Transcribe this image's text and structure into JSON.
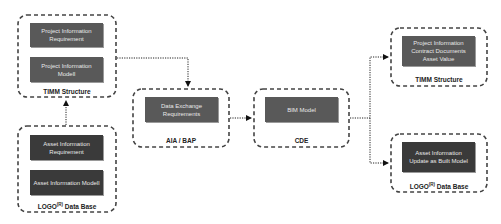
{
  "groups": {
    "timm_left": {
      "label": "TIMM Structure",
      "nodes": [
        "Project Information\nRequirement",
        "Project Information\nModell"
      ]
    },
    "logo_left": {
      "label_main": "LOGO",
      "label_sup": "(R)",
      "label_rest": " Data Base",
      "nodes": [
        "Asset Information\nRequirement",
        "Asset Information Modell"
      ]
    },
    "aia_bap": {
      "label": "AIA / BAP",
      "nodes": [
        "Data Exchange\nRequirements"
      ]
    },
    "cde": {
      "label": "CDE",
      "nodes": [
        "BIM Model"
      ]
    },
    "timm_right": {
      "label": "TIMM Structure",
      "nodes": [
        "Project Information\nContract Documents\nAsset Value"
      ]
    },
    "logo_right": {
      "label_main": "LOGO",
      "label_sup": "(R)",
      "label_rest": " Data Base",
      "nodes": [
        "Asset Information\nUpdate as Built Model"
      ]
    }
  },
  "colors": {
    "node_fill": "#595959",
    "node_fill_dark": "#3a3a3a",
    "node_text": "#e8e8e8",
    "border": "#444444"
  }
}
